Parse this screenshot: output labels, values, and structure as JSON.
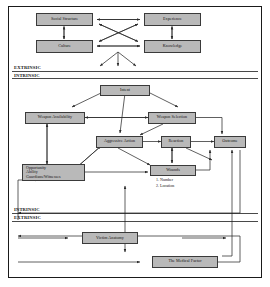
{
  "diagram": {
    "title_caption": "",
    "colors": {
      "node_fill": "#b9b9b9",
      "node_border": "#3a3a3a",
      "line": "#2b2b2b",
      "frame": "#1a1a1a"
    },
    "dividers": [
      {
        "id": "upper",
        "above_label": "EXTRINSIC",
        "below_label": "INTRINSIC"
      },
      {
        "id": "lower",
        "above_label": "INTRINSIC",
        "below_label": "EXTRINSIC"
      }
    ],
    "nodes": {
      "social_structure": "Social Structure",
      "experience": "Experience",
      "culture": "Culture",
      "knowledge": "Knowledge",
      "intent": "Intent",
      "weapon_availability": "Weapon Availability",
      "weapon_selection": "Weapon Selection",
      "aggressive_action": "Aggressive Action",
      "reaction": "Reaction",
      "outcome": "Outcome",
      "opportunity": "Opportunity",
      "ability": "Ability",
      "guardians_witnesses": "Guardians/Witnesses",
      "wounds": "Wounds",
      "wounds_item_1": "1. Number",
      "wounds_item_2": "2. Location",
      "victim_anatomy": "Victim Anatomy",
      "medical_factor": "The Medical Factor"
    }
  }
}
